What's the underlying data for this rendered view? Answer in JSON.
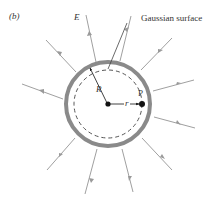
{
  "figure": {
    "panel_label": "(b)",
    "field_label": "E",
    "surface_label": "Gaussian surface",
    "radius_label": "R",
    "distance_label": "r",
    "point_label": "P"
  },
  "colors": {
    "shell": "#8a8a8a",
    "field_line": "#a0a0a0",
    "dashed": "#555555",
    "ink": "#111111"
  }
}
